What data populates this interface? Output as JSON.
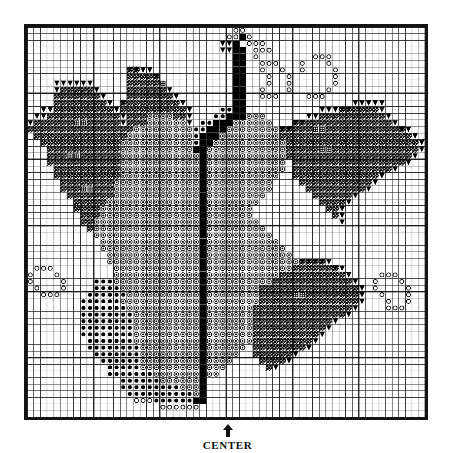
{
  "document": {
    "type": "needlework-chart",
    "title": "Grape Cluster and Leaves Chart",
    "center_label": "CENTER",
    "arrow_icon": "up-arrow-icon"
  },
  "grid": {
    "columns": 60,
    "rows": 59,
    "cell_px": 6.72,
    "minor_line_color": "#222222",
    "major_line_color": "#000000",
    "major_every": 10,
    "border_color": "#141414",
    "background": "#ffffff"
  },
  "legend": {
    "symbols": [
      {
        "key": "hatch",
        "name": "diagonal-hatch-cell",
        "meaning": "leaf"
      },
      {
        "key": "ring",
        "name": "open-circle-cell",
        "meaning": "light grape"
      },
      {
        "key": "dot",
        "name": "filled-dot-cell",
        "meaning": "dark grape"
      },
      {
        "key": "ringdot",
        "name": "ring-with-dot-cell",
        "meaning": "shaded grape"
      },
      {
        "key": "tri",
        "name": "solid-triangle-cell",
        "meaning": "outline edge"
      },
      {
        "key": "cross",
        "name": "crossed-square-cell",
        "meaning": "leaf vein"
      },
      {
        "key": "solid",
        "name": "solid-black-cell",
        "meaning": "stem"
      }
    ]
  },
  "chart_data": {
    "type": "heatmap",
    "title": "Grape Cluster and Leaves Chart",
    "xlabel": "",
    "ylabel": "",
    "grid": true,
    "legend_position": "none",
    "cols": 60,
    "rows": 59,
    "encoding": {
      "0": "empty",
      "1": "hatch",
      "2": "ring",
      "3": "dot",
      "4": "ringdot",
      "5": "tri",
      "6": "cross",
      "7": "solid"
    },
    "regions": [
      {
        "name": "top-tendril-stem",
        "symbol": "solid",
        "bbox": [
          30,
          3,
          2,
          14
        ]
      },
      {
        "name": "top-tendril-rings",
        "symbol": "ring",
        "bbox": [
          31,
          1,
          6,
          5
        ]
      },
      {
        "name": "upper-right-rings",
        "symbol": "ring",
        "bbox": [
          36,
          6,
          12,
          9
        ]
      },
      {
        "name": "left-leaf-upper",
        "symbol": "hatch",
        "bbox": [
          8,
          8,
          18,
          14
        ]
      },
      {
        "name": "left-leaf-lower",
        "symbol": "hatch",
        "bbox": [
          5,
          16,
          16,
          16
        ]
      },
      {
        "name": "mid-left-leaf",
        "symbol": "hatch",
        "bbox": [
          18,
          6,
          10,
          8
        ]
      },
      {
        "name": "right-leaf-upper",
        "symbol": "hatch",
        "bbox": [
          41,
          11,
          18,
          14
        ]
      },
      {
        "name": "right-leaf-lower",
        "symbol": "hatch",
        "bbox": [
          40,
          34,
          16,
          14
        ]
      },
      {
        "name": "grape-cluster-core",
        "symbol": "ringdot",
        "bbox": [
          17,
          13,
          24,
          34
        ]
      },
      {
        "name": "grape-cluster-left",
        "symbol": "dot",
        "bbox": [
          14,
          38,
          12,
          14
        ]
      },
      {
        "name": "grape-lower-tail",
        "symbol": "ring",
        "bbox": [
          12,
          50,
          8,
          7
        ]
      },
      {
        "name": "left-berry-sprig",
        "symbol": "ring",
        "bbox": [
          1,
          36,
          12,
          7
        ]
      },
      {
        "name": "right-berry-sprig",
        "symbol": "ring",
        "bbox": [
          48,
          36,
          10,
          8
        ]
      }
    ],
    "values": [
      "000000000000000000000000000000022000000000000000000000000000",
      "000000000000000000000000000000227200000000000000000000000000",
      "000000000000000000000000000005570222000000000000000000000000",
      "000000000000000000000000000005577022200000000000000000000000",
      "000000000000000000000000000000077020000000022200000000000000",
      "000000000000000000000000000000077002220002000200000000000000",
      "000000000000000115500000000000077002002002000020000000000000",
      "000000000000000111110000000000077000200200000020000000000000",
      "000055555500000111116000000000077000200200000020000000000000",
      "000051111150000111111500000000077002000200000200000000000000",
      "000011111115000111111150000000077002220000222000000000000000",
      "000011111111501111111115000000077000000000000000055555000000",
      "005511111111151111111111500003377000000000005551111115000000",
      "055111111111115111444411500033777444000000551111111111500000",
      "511111166111115111444444503377744444400011111111111111150000",
      "111111111111111144444444433777444444441111166111111111111500",
      "011111111111111444444444437774444444441111111111111111111150",
      "001111111111114444444444437744444444444111111111111111111115",
      "000111111111114444444444477444444444444111116611111111111115",
      "000111661111114444444444447444444444444111111111111111111150",
      "000111111111114444444444447444444444444011111111111111111500",
      "000011111111114444444444447444444444444011111111111111150000",
      "000011111111114444444444447444444444440011111111111115000000",
      "000001111111144444444444447444444444400001111111111150000000",
      "000001116611144444444444447444444444400000111111111500000000",
      "000000111111144444444444447444444444000000011111150000000000",
      "000000011111444444444444447444444440000000001111500000000000",
      "000000011114444444444444447444444400000000000115000000000000",
      "000000001114444444444444447444444400000000000015000000000000",
      "000000001144444444444444447444444440000000000005000000000000",
      "000000000144444444444444447444444444000000000000000000000000",
      "000000000044444444444444447444444444400000000000000000000000",
      "000000000004444444444444447444444444440000000000000000000000",
      "000000000004444444444444447444444444444000000000000000000000",
      "000000000000444444444444447444444444444400000000000000000000",
      "000000000000444444444444447444444444444441111500000000000000",
      "022200000000044444444444447444444444444411111115000000000000",
      "200020000000044444444444447444444444441111111111500002220000",
      "200002000033344444444444447444444444411111111111150020002000",
      "020002000033334444444444447444444441111111111111115020000200",
      "002220000333333444444444447444444441111166111111115002000200",
      "000000003333334444444444447444444441111111111111115000200200",
      "000000003333333444444444447444444411111111111111150000222000",
      "000000003333333344444444447444444411111111111111500000000000",
      "000000003333333344444444447444444411111111111150000000000000",
      "000000003333333344444444447444444411111111111500000000000000",
      "000000003333333344444444447444444411111111115000000000000000",
      "000000000333333344444444447444444411111111150000000000000000",
      "000000000333333334444444447444444011111111500000000000000000",
      "000000000033333334444444447444440011111150000000000000000000",
      "000000000003333334444444447444400001111500000000000000000000",
      "000000000000333334444444447444000000150000000000000000000000",
      "000000000000333333344444447440000000000000000000000000000000",
      "000000000000003333334444447000000000000000000000000000000000",
      "000000000000003333333334447000000000000000000000000000000000",
      "000000000000000333333333347000000000000000000000000000000000",
      "000000000000000022233333377000000000000000000000000000000000",
      "000000000000000000002222220000000000000000000000000000000000",
      "000000000000000000000000000000000000000000000000000000000000"
    ]
  }
}
